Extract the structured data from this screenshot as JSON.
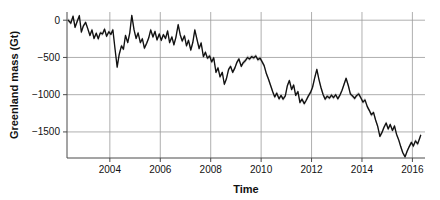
{
  "chart_data": {
    "type": "line",
    "title": "",
    "xlabel": "Time",
    "ylabel": "Greenland mass (Gt)",
    "xlim": [
      2002.3,
      2016.5
    ],
    "ylim": [
      -1850,
      110
    ],
    "grid": true,
    "legend": false,
    "xticks": [
      2004,
      2006,
      2008,
      2010,
      2012,
      2014,
      2016
    ],
    "xticklabels": [
      "2004",
      "2006",
      "2008",
      "2010",
      "2012",
      "2014",
      "2016"
    ],
    "yticks": [
      0,
      -500,
      -1000,
      -1500
    ],
    "yticklabels": [
      "0",
      "-500",
      "-1000",
      "-1500"
    ],
    "series": [
      {
        "name": "Greenland mass anomaly",
        "color": "#111111",
        "uncertainty_color": "#b4b4b4",
        "uncertainty_band_gt": 28,
        "x": [
          2002.35,
          2002.45,
          2002.54,
          2002.62,
          2002.71,
          2002.79,
          2002.87,
          2002.95,
          2003.04,
          2003.12,
          2003.21,
          2003.29,
          2003.37,
          2003.46,
          2003.54,
          2003.62,
          2003.71,
          2003.79,
          2003.87,
          2003.96,
          2004.04,
          2004.12,
          2004.21,
          2004.29,
          2004.37,
          2004.46,
          2004.54,
          2004.62,
          2004.71,
          2004.79,
          2004.87,
          2004.96,
          2005.04,
          2005.12,
          2005.21,
          2005.29,
          2005.37,
          2005.46,
          2005.54,
          2005.62,
          2005.71,
          2005.79,
          2005.87,
          2005.96,
          2006.04,
          2006.12,
          2006.21,
          2006.29,
          2006.37,
          2006.46,
          2006.54,
          2006.62,
          2006.71,
          2006.79,
          2006.87,
          2006.96,
          2007.04,
          2007.12,
          2007.21,
          2007.29,
          2007.37,
          2007.46,
          2007.54,
          2007.62,
          2007.71,
          2007.79,
          2007.87,
          2007.96,
          2008.04,
          2008.12,
          2008.21,
          2008.29,
          2008.37,
          2008.46,
          2008.54,
          2008.62,
          2008.71,
          2008.79,
          2008.87,
          2008.96,
          2009.04,
          2009.12,
          2009.21,
          2009.29,
          2009.37,
          2009.46,
          2009.54,
          2009.62,
          2009.71,
          2009.79,
          2009.87,
          2009.96,
          2010.04,
          2010.12,
          2010.21,
          2010.29,
          2010.37,
          2010.46,
          2010.54,
          2010.62,
          2010.71,
          2010.79,
          2010.87,
          2010.96,
          2011.04,
          2011.12,
          2011.21,
          2011.29,
          2011.37,
          2011.46,
          2011.54,
          2011.62,
          2011.71,
          2011.79,
          2011.87,
          2011.96,
          2012.04,
          2012.12,
          2012.21,
          2012.29,
          2012.37,
          2012.46,
          2012.54,
          2012.62,
          2012.71,
          2012.79,
          2012.87,
          2012.96,
          2013.04,
          2013.12,
          2013.21,
          2013.29,
          2013.37,
          2013.46,
          2013.54,
          2013.62,
          2013.71,
          2013.79,
          2013.87,
          2013.96,
          2014.04,
          2014.12,
          2014.21,
          2014.29,
          2014.37,
          2014.46,
          2014.54,
          2014.62,
          2014.71,
          2014.79,
          2014.87,
          2014.96,
          2015.04,
          2015.12,
          2015.21,
          2015.29,
          2015.37,
          2015.46,
          2015.54,
          2015.62,
          2015.71,
          2015.79,
          2015.87,
          2015.96,
          2016.04,
          2016.12,
          2016.21,
          2016.33
        ],
        "y": [
          0,
          -40,
          55,
          -95,
          -10,
          60,
          -160,
          -75,
          -30,
          -110,
          -205,
          -130,
          -245,
          -175,
          -250,
          -170,
          -185,
          -120,
          -215,
          -155,
          -190,
          -130,
          -400,
          -630,
          -460,
          -345,
          -390,
          -205,
          -300,
          -170,
          65,
          -130,
          -245,
          -170,
          -300,
          -250,
          -375,
          -310,
          -240,
          -130,
          -225,
          -150,
          -265,
          -185,
          -270,
          -195,
          -245,
          -145,
          -300,
          -225,
          -330,
          -230,
          -60,
          -195,
          -280,
          -210,
          -345,
          -270,
          -400,
          -300,
          -130,
          -265,
          -380,
          -305,
          -490,
          -430,
          -510,
          -480,
          -560,
          -505,
          -700,
          -640,
          -760,
          -700,
          -860,
          -790,
          -660,
          -620,
          -700,
          -640,
          -565,
          -520,
          -620,
          -570,
          -545,
          -500,
          -520,
          -490,
          -505,
          -480,
          -530,
          -510,
          -560,
          -610,
          -720,
          -790,
          -870,
          -960,
          -1030,
          -980,
          -1055,
          -1010,
          -1060,
          -1015,
          -880,
          -810,
          -930,
          -870,
          -1010,
          -960,
          -1105,
          -1060,
          -1120,
          -1075,
          -1020,
          -970,
          -900,
          -780,
          -660,
          -790,
          -900,
          -1000,
          -1060,
          -1020,
          -1045,
          -1005,
          -1040,
          -1000,
          -1055,
          -1010,
          -940,
          -860,
          -780,
          -880,
          -990,
          -1015,
          -1050,
          -1010,
          -990,
          -1045,
          -1100,
          -1070,
          -1160,
          -1210,
          -1270,
          -1240,
          -1340,
          -1420,
          -1560,
          -1510,
          -1440,
          -1380,
          -1460,
          -1400,
          -1480,
          -1420,
          -1530,
          -1610,
          -1700,
          -1780,
          -1835,
          -1760,
          -1700,
          -1640,
          -1690,
          -1620,
          -1660,
          -1545
        ]
      }
    ]
  },
  "axes": {
    "x_title": "Time",
    "y_title": "Greenland mass (Gt)"
  }
}
